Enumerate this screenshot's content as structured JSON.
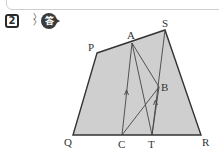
{
  "header": {
    "problem_number": "2",
    "answer_badge": "答"
  },
  "diagram": {
    "type": "geometry-quadrilateral",
    "fill_color": "#cfcfcf",
    "stroke_color": "#333333",
    "points": {
      "P": {
        "label": "P",
        "x": 97,
        "y": 53
      },
      "A": {
        "label": "A",
        "x": 132,
        "y": 43
      },
      "S": {
        "label": "S",
        "x": 165,
        "y": 30
      },
      "Q": {
        "label": "Q",
        "x": 73,
        "y": 135
      },
      "C": {
        "label": "C",
        "x": 122,
        "y": 135
      },
      "T": {
        "label": "T",
        "x": 152,
        "y": 135
      },
      "R": {
        "label": "R",
        "x": 201,
        "y": 135
      },
      "B": {
        "label": "B",
        "x": 159,
        "y": 87
      }
    },
    "segments": [
      "PS",
      "SR",
      "RQ",
      "QP",
      "AC",
      "AT",
      "ST",
      "CB",
      "AB"
    ],
    "parallel_marks": [
      "AC",
      "BT"
    ]
  }
}
